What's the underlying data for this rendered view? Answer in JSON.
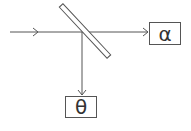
{
  "diagram": {
    "type": "beam-splitter",
    "line_color": "#555555",
    "labels": {
      "transmitted": "α",
      "reflected": "θ"
    },
    "elements": {
      "input_beam": "incoming beam from left",
      "mirror": "tilted beam splitter",
      "transmitted_beam": "beam continuing right to α",
      "reflected_beam": "beam reflected down to θ"
    }
  }
}
